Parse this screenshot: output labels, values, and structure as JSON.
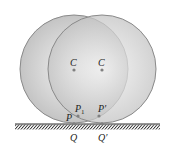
{
  "diagram": {
    "circles": [
      {
        "id": "left",
        "center_label": "C",
        "cx": 74,
        "cy": 69,
        "r": 54
      },
      {
        "id": "right",
        "center_label": "C",
        "cx": 102,
        "cy": 69,
        "r": 54
      }
    ],
    "labels": {
      "center_left": "C",
      "center_right": "C",
      "p": "P",
      "p1_main": "P",
      "p1_sub": "1",
      "p_prime": "P′",
      "q": "Q",
      "q_prime": "Q′"
    },
    "colors": {
      "circle_fill_outer": "#c8c8c8",
      "circle_fill_inner": "#f2f2f2",
      "circle_stroke": "#8a8a8a",
      "ground": "#333333",
      "point": "#808080"
    }
  }
}
